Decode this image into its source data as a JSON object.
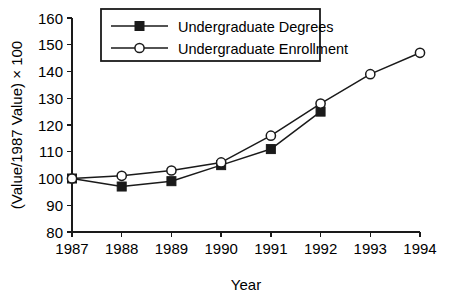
{
  "chart_data": {
    "type": "line",
    "title": "",
    "xlabel": "Year",
    "ylabel": "(Value/1987 Value) × 100",
    "x": [
      1987,
      1988,
      1989,
      1990,
      1991,
      1992,
      1993,
      1994
    ],
    "categories": [
      "1987",
      "1988",
      "1989",
      "1990",
      "1991",
      "1992",
      "1993",
      "1994"
    ],
    "xlim": [
      1987,
      1994
    ],
    "ylim": [
      80,
      160
    ],
    "yticks": [
      80,
      90,
      100,
      110,
      120,
      130,
      140,
      150,
      160
    ],
    "ytick_labels": [
      "80",
      "90",
      "100",
      "110",
      "120",
      "130",
      "140",
      "150",
      "160"
    ],
    "xticks": [
      1987,
      1988,
      1989,
      1990,
      1991,
      1992,
      1993,
      1994
    ],
    "xtick_labels": [
      "1987",
      "1988",
      "1989",
      "1990",
      "1991",
      "1992",
      "1993",
      "1994"
    ],
    "grid": false,
    "legend_position": "top-left-inside",
    "series": [
      {
        "name": "Undergraduate Degrees",
        "marker": "filled-square",
        "x": [
          1987,
          1988,
          1989,
          1990,
          1991,
          1992
        ],
        "values": [
          100,
          97,
          99,
          105,
          111,
          125
        ]
      },
      {
        "name": "Undergraduate Enrollment",
        "marker": "open-circle",
        "x": [
          1987,
          1988,
          1989,
          1990,
          1991,
          1992,
          1993,
          1994
        ],
        "values": [
          100,
          101,
          103,
          106,
          116,
          128,
          139,
          147
        ]
      }
    ]
  },
  "legend": {
    "items": [
      {
        "label": "Undergraduate Degrees",
        "marker": "filled-square"
      },
      {
        "label": "Undergraduate Enrollment",
        "marker": "open-circle"
      }
    ]
  },
  "colors": {
    "ink": "#1a1a1a",
    "background": "#ffffff"
  }
}
